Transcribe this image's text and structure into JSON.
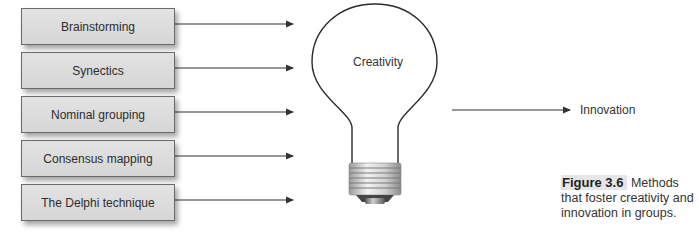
{
  "methods": [
    {
      "label": "Brainstorming",
      "top": 8
    },
    {
      "label": "Synectics",
      "top": 52
    },
    {
      "label": "Nominal grouping",
      "top": 96
    },
    {
      "label": "Consensus mapping",
      "top": 140
    },
    {
      "label": "The Delphi technique",
      "top": 184
    }
  ],
  "bulb": {
    "label": "Creativity"
  },
  "outcome": {
    "label": "Innovation"
  },
  "caption": {
    "figure_number": "Figure 3.6",
    "text": "Methods that foster creativity and innovation in groups."
  },
  "colors": {
    "box_fill": "#dcdcdc",
    "box_border": "#6a6a6a",
    "line": "#333333"
  }
}
